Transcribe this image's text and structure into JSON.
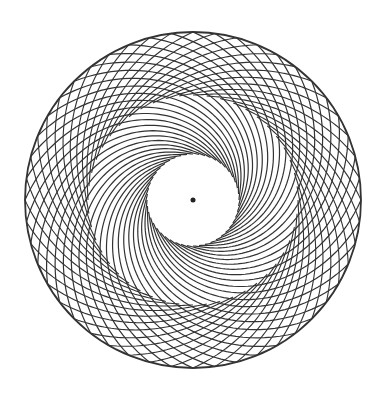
{
  "figure": {
    "type": "circular-arc-pattern",
    "background": "#ffffff",
    "stroke": "#333333",
    "center": [
      193,
      200
    ],
    "outer_radius": 168,
    "center_dot_radius": 2.5,
    "swirl_family": {
      "count": 48,
      "inner_radius": 46,
      "sweep_deg": 150
    },
    "cross_family": {
      "count": 48,
      "inner_radius": 105,
      "sweep_deg": 75
    }
  }
}
